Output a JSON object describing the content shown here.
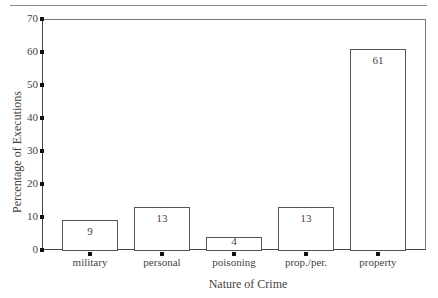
{
  "chart_data": {
    "type": "bar",
    "title": "",
    "xlabel": "Nature of Crime",
    "ylabel": "Percentage of Executions",
    "categories": [
      "military",
      "personal",
      "poisoning",
      "prop./per.",
      "property"
    ],
    "values": [
      9,
      13,
      4,
      13,
      61
    ],
    "value_labels": [
      "9",
      "13",
      "4",
      "13",
      "61"
    ],
    "ylim": [
      0,
      70
    ],
    "yticks": [
      "0",
      "10",
      "20",
      "30",
      "40",
      "50",
      "60",
      "70"
    ],
    "grid": false,
    "legend": null
  }
}
